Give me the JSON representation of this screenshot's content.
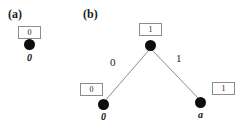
{
  "figure": {
    "width": 246,
    "height": 126,
    "background": "#ffffff",
    "line_color": "#8c8c8c",
    "node_color": "#0d0d0d",
    "box_border_color": "#8c8c8c"
  },
  "panels": {
    "a": {
      "label": "(a)",
      "box_value": "0",
      "node_label": "0"
    },
    "b": {
      "label": "(b)",
      "root": {
        "box_value": "1"
      },
      "left_leaf": {
        "box_value": "0",
        "node_label": "0",
        "edge_label": "0"
      },
      "right_leaf": {
        "box_value": "1",
        "node_label": "a",
        "edge_label": "1"
      }
    }
  }
}
